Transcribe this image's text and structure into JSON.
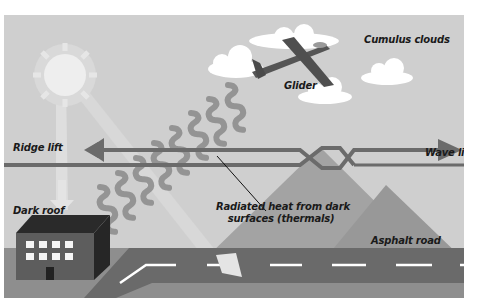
{
  "diagram": {
    "labels": {
      "cumulus": "Cumulus clouds",
      "glider": "Glider",
      "ridge_lift": "Ridge lift",
      "wave_lift": "Wave lift",
      "thermals_line1": "Radiated heat from dark",
      "thermals_line2": "surfaces (thermals)",
      "dark_roof": "Dark roof",
      "asphalt_road": "Asphalt road"
    },
    "elements": {
      "sun": "sun-icon",
      "glider": "glider-plane-icon",
      "clouds": 5,
      "building_windows": 8,
      "mountains": 2,
      "thermal_waves": 8
    },
    "colors": {
      "sky": "#cfcfcf",
      "sun": "#ececec",
      "cloud": "#ffffff",
      "arrow": "#6b6b6b",
      "mountain": "#9e9e9e",
      "ground": "#8f8f8f",
      "road": "#6a6a6a",
      "building": "#5d5d5d",
      "building_roof": "#2a2a2a",
      "glider": "#555555",
      "text": "#1a1a1a"
    }
  }
}
